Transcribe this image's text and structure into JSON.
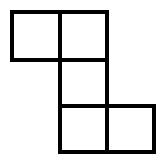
{
  "diagram": {
    "type": "polyomino",
    "cell_count": 5,
    "stroke_color": "#000000",
    "fill_color": "#ffffff",
    "cells": [
      {
        "col": 0,
        "row": 0,
        "x": 10,
        "y": 10,
        "w": 52,
        "h": 52
      },
      {
        "col": 1,
        "row": 0,
        "x": 58,
        "y": 10,
        "w": 51,
        "h": 52
      },
      {
        "col": 1,
        "row": 1,
        "x": 58,
        "y": 58,
        "w": 51,
        "h": 50
      },
      {
        "col": 1,
        "row": 2,
        "x": 58,
        "y": 104,
        "w": 51,
        "h": 50
      },
      {
        "col": 2,
        "row": 2,
        "x": 105,
        "y": 104,
        "w": 51,
        "h": 50
      }
    ]
  }
}
